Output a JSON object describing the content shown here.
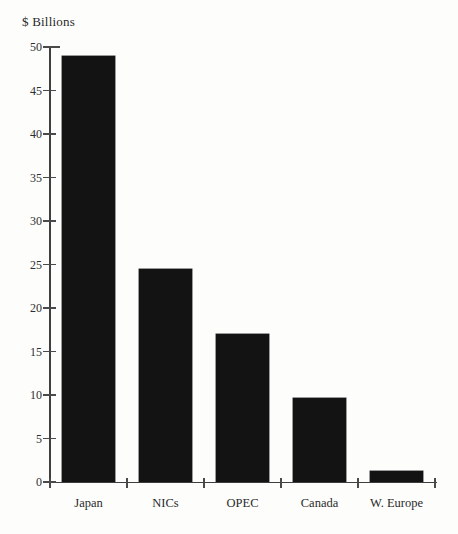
{
  "chart_data": {
    "type": "bar",
    "categories": [
      "Japan",
      "NICs",
      "OPEC",
      "Canada",
      "W. Europe"
    ],
    "values": [
      49,
      24.5,
      17,
      9.7,
      1.3
    ],
    "title": "",
    "xlabel": "",
    "ylabel": "$ Billions",
    "ylim": [
      0,
      50
    ],
    "ytick_step": 5,
    "yticks": [
      0,
      5,
      10,
      15,
      20,
      25,
      30,
      35,
      40,
      45,
      50
    ],
    "grid": false,
    "legend": "none",
    "bar_color": "#131313",
    "axis_color": "#3f3f3f",
    "background_color": "#fdfdfc"
  }
}
